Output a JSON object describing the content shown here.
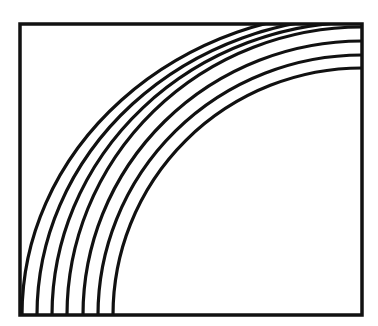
{
  "figure": {
    "stroke_color": "#111111",
    "background": "#ffffff",
    "frame": {
      "x": 20,
      "y": 24,
      "width": 342,
      "height": 291
    },
    "arc_center": {
      "x": 362,
      "y": 315
    },
    "arcs": [
      {
        "rx": 340,
        "ry": 304
      },
      {
        "rx": 325,
        "ry": 298
      },
      {
        "rx": 310,
        "ry": 293
      },
      {
        "rx": 295,
        "ry": 288
      },
      {
        "rx": 279,
        "ry": 274
      },
      {
        "rx": 264,
        "ry": 260
      },
      {
        "rx": 249,
        "ry": 247
      }
    ]
  }
}
